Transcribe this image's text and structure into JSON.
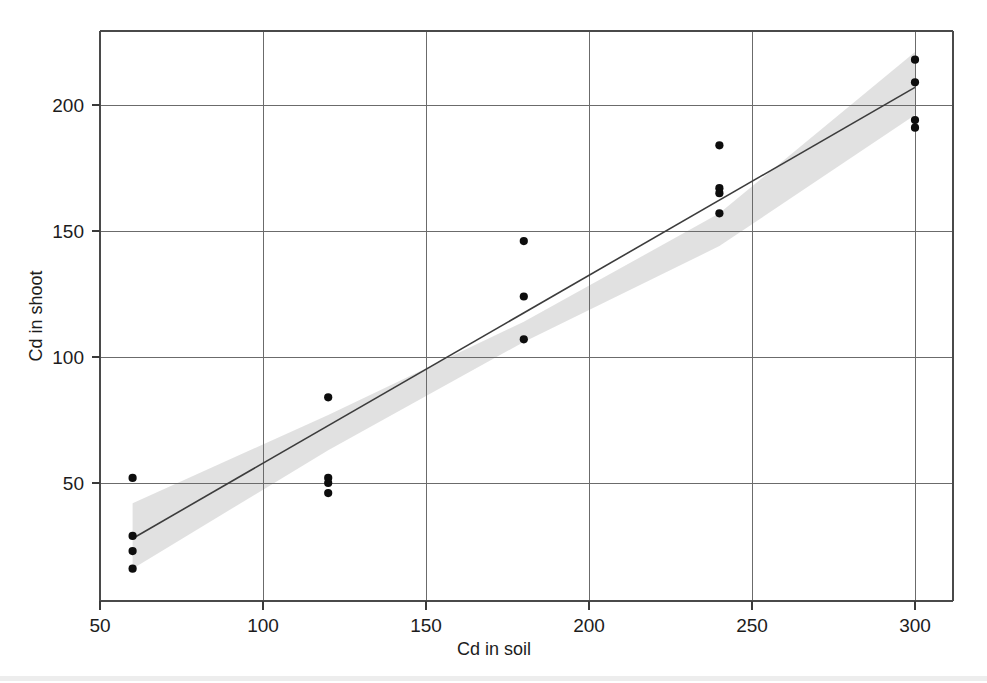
{
  "chart_data": {
    "type": "scatter",
    "title": "",
    "xlabel": "Cd in soil",
    "ylabel": "Cd in shoot",
    "xlim": [
      50,
      311
    ],
    "ylim": [
      0,
      234
    ],
    "xticks": [
      50,
      100,
      150,
      200,
      250,
      300
    ],
    "yticks": [
      50,
      100,
      150,
      200
    ],
    "xtick_labels": [
      "50",
      "100",
      "150",
      "200",
      "250",
      "300"
    ],
    "ytick_labels": [
      "50",
      "100",
      "150",
      "200"
    ],
    "grid": true,
    "legend": null,
    "legend_position": "none",
    "series": [
      {
        "name": "observations",
        "marker": "filled-circle",
        "color": "#0d0d0d",
        "points": [
          {
            "x": 60,
            "y": 52
          },
          {
            "x": 60,
            "y": 29
          },
          {
            "x": 60,
            "y": 23
          },
          {
            "x": 60,
            "y": 16
          },
          {
            "x": 120,
            "y": 84
          },
          {
            "x": 120,
            "y": 52
          },
          {
            "x": 120,
            "y": 50
          },
          {
            "x": 120,
            "y": 46
          },
          {
            "x": 180,
            "y": 146
          },
          {
            "x": 180,
            "y": 124
          },
          {
            "x": 180,
            "y": 107
          },
          {
            "x": 240,
            "y": 184
          },
          {
            "x": 240,
            "y": 167
          },
          {
            "x": 240,
            "y": 165
          },
          {
            "x": 240,
            "y": 157
          },
          {
            "x": 300,
            "y": 218
          },
          {
            "x": 300,
            "y": 209
          },
          {
            "x": 300,
            "y": 194
          },
          {
            "x": 300,
            "y": 191
          }
        ]
      }
    ],
    "fit_line": {
      "name": "regression line",
      "color": "#3c3c3c",
      "x_start": 60,
      "x_end": 300,
      "y_start": 28,
      "y_end": 207,
      "slope": 0.746,
      "intercept": -16.8
    },
    "confidence_band": {
      "name": "confidence interval",
      "color": "#cfcfcf",
      "x": [
        60,
        120,
        180,
        240,
        300
      ],
      "upper": [
        42,
        77,
        114,
        157,
        221
      ],
      "lower": [
        16,
        63,
        106,
        144,
        196
      ]
    }
  },
  "axis": {
    "x_title": "Cd in soil",
    "y_title": "Cd in shoot"
  }
}
